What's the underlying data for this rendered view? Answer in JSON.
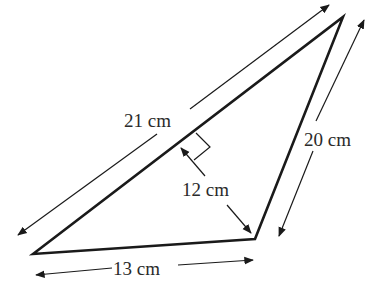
{
  "diagram": {
    "type": "triangle",
    "colors": {
      "stroke": "#1a1a1a",
      "text": "#2a2a2a",
      "background": "#ffffff"
    },
    "vertices": {
      "A": [
        33,
        254
      ],
      "B": [
        343,
        17
      ],
      "C": [
        255,
        239
      ]
    },
    "labels": {
      "side_ab": "21 cm",
      "side_bc": "20 cm",
      "side_ac": "13 cm",
      "height": "12 cm"
    },
    "right_angle_marker": true
  }
}
